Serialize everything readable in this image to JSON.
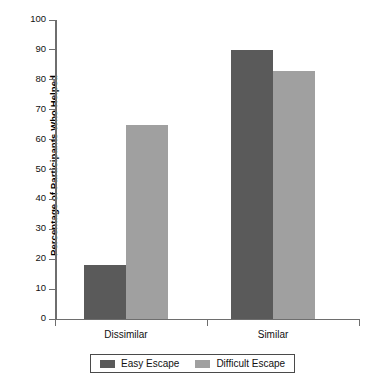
{
  "chart_data": {
    "type": "bar",
    "title": "",
    "xlabel": "",
    "ylabel": "Percentage of Participants Who Helped",
    "categories": [
      "Dissimilar",
      "Similar"
    ],
    "series": [
      {
        "name": "Easy Escape",
        "color": "#5a5a5a",
        "values": [
          18,
          65
        ]
      },
      {
        "name": "Difficult Escape",
        "color": "#a0a0a0",
        "values": [
          18,
          83
        ]
      }
    ],
    "series_corrected": [
      {
        "name": "Easy Escape",
        "color": "#5a5a5a",
        "values": [
          18,
          90
        ]
      },
      {
        "name": "Difficult Escape",
        "color": "#a0a0a0",
        "values": [
          65,
          83
        ]
      }
    ],
    "ylim": [
      0,
      100
    ],
    "ytick_step": 10,
    "yticks": [
      0,
      10,
      20,
      30,
      40,
      50,
      60,
      70,
      80,
      90,
      100
    ],
    "ytick_labels": [
      "0",
      "10",
      "20",
      "30",
      "40",
      "50",
      "60",
      "70",
      "80",
      "90",
      "100"
    ],
    "grid": false,
    "legend_position": "bottom",
    "bar_groups": [
      {
        "category": "Dissimilar",
        "bars": [
          {
            "series": "Easy Escape",
            "value": 18,
            "color": "#5a5a5a"
          },
          {
            "series": "Difficult Escape",
            "value": 65,
            "color": "#a0a0a0"
          }
        ]
      },
      {
        "category": "Similar",
        "bars": [
          {
            "series": "Easy Escape",
            "value": 90,
            "color": "#5a5a5a"
          },
          {
            "series": "Difficult Escape",
            "value": 83,
            "color": "#a0a0a0"
          }
        ]
      }
    ]
  },
  "axis": {
    "y_title": "Percentage of Participants Who Helped",
    "y_labels": [
      "100",
      "90",
      "80",
      "70",
      "60",
      "50",
      "40",
      "30",
      "20",
      "10",
      "0"
    ],
    "x_labels": [
      "Dissimilar",
      "Similar"
    ]
  },
  "legend": {
    "items": [
      {
        "label": "Easy Escape",
        "color": "#5a5a5a"
      },
      {
        "label": "Difficult Escape",
        "color": "#a0a0a0"
      }
    ]
  },
  "colors": {
    "easy_escape": "#5a5a5a",
    "difficult_escape": "#a0a0a0",
    "axis": "#6e6e6e",
    "background": "#ffffff",
    "text": "#111111"
  }
}
